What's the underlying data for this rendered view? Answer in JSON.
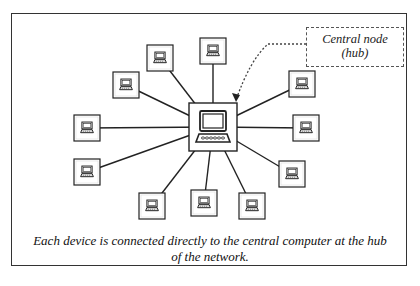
{
  "callout": {
    "line1": "Central node",
    "line2": "(hub)"
  },
  "caption": "Each device is connected directly to the central computer at the hub of the network.",
  "hub": {
    "name": "central-computer",
    "icon": "computer-icon"
  },
  "devices": [
    {
      "id": "device-1",
      "icon": "laptop-icon"
    },
    {
      "id": "device-2",
      "icon": "laptop-icon"
    },
    {
      "id": "device-3",
      "icon": "laptop-icon"
    },
    {
      "id": "device-4",
      "icon": "laptop-icon"
    },
    {
      "id": "device-5",
      "icon": "laptop-icon"
    },
    {
      "id": "device-6",
      "icon": "laptop-icon"
    },
    {
      "id": "device-7",
      "icon": "laptop-icon"
    },
    {
      "id": "device-8",
      "icon": "laptop-icon"
    },
    {
      "id": "device-9",
      "icon": "laptop-icon"
    },
    {
      "id": "device-10",
      "icon": "laptop-icon"
    },
    {
      "id": "device-11",
      "icon": "laptop-icon"
    },
    {
      "id": "device-12",
      "icon": "laptop-icon"
    }
  ],
  "colors": {
    "stroke": "#222222",
    "background": "#ffffff"
  }
}
